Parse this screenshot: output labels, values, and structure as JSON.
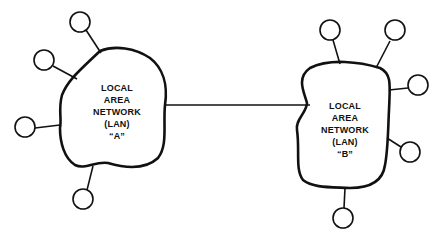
{
  "diagram": {
    "lan_a": {
      "lines": [
        "LOCAL",
        "AREA",
        "NETWORK",
        "(LAN)",
        "“A”"
      ]
    },
    "lan_b": {
      "lines": [
        "LOCAL",
        "AREA",
        "NETWORK",
        "(LAN)",
        "“B”"
      ]
    },
    "colors": {
      "stroke": "#111111",
      "background": "#ffffff"
    }
  }
}
